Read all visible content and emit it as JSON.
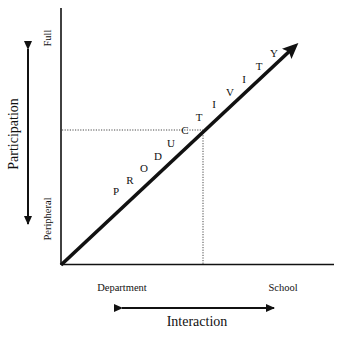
{
  "diagram": {
    "type": "conceptual-axes",
    "y_axis": {
      "title": "Participation",
      "low_label": "Peripheral",
      "high_label": "Full"
    },
    "x_axis": {
      "title": "Interaction",
      "low_label": "Department",
      "high_label": "School"
    },
    "diagonal": {
      "label": "PRODUCTIVITY",
      "letters": [
        "P",
        "R",
        "O",
        "D",
        "U",
        "C",
        "T",
        "I",
        "V",
        "I",
        "T",
        "Y"
      ]
    },
    "reference_lines": "dotted projection from diagonal to both axes",
    "colors": {
      "line": "#111111",
      "background": "#ffffff"
    }
  }
}
